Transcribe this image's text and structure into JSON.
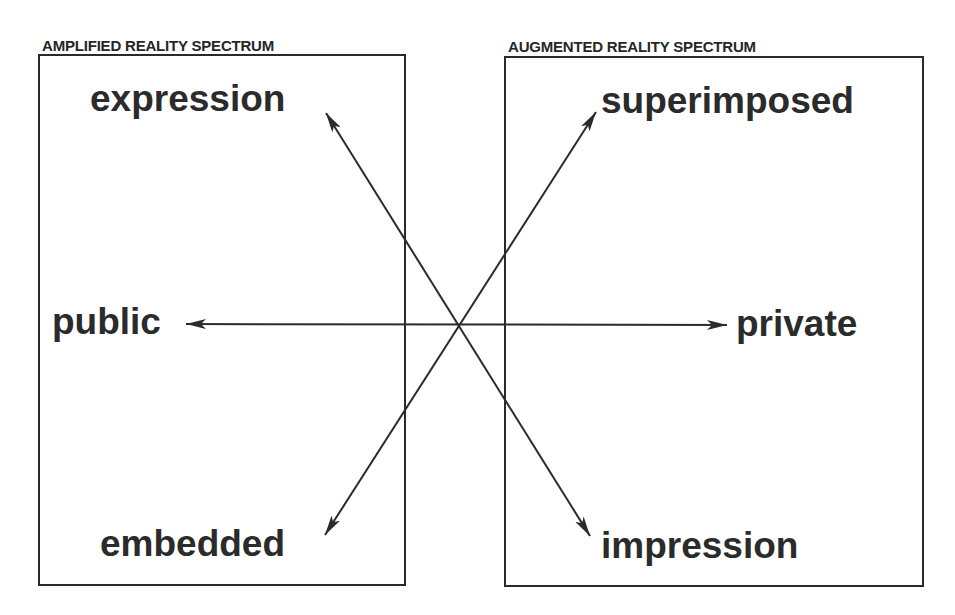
{
  "diagram": {
    "left_box": {
      "title": "AMPLIFIED REALITY SPECTRUM"
    },
    "right_box": {
      "title": "AUGMENTED REALITY SPECTRUM"
    },
    "terms": {
      "expression": "expression",
      "superimposed": "superimposed",
      "public": "public",
      "private": "private",
      "embedded": "embedded",
      "impression": "impression"
    },
    "axes": [
      {
        "from": "public",
        "to": "private",
        "arrowheads": "both",
        "orientation": "horizontal"
      },
      {
        "from": "expression",
        "to": "impression",
        "arrowheads": "both",
        "orientation": "diagonal"
      },
      {
        "from": "superimposed",
        "to": "embedded",
        "arrowheads": "both",
        "orientation": "diagonal"
      }
    ],
    "colors": {
      "ink": "#2b2b2b",
      "background": "#ffffff"
    }
  }
}
